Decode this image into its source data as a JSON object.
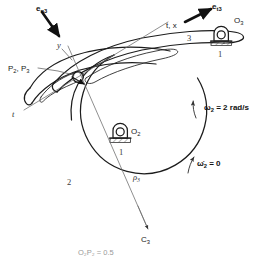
{
  "figure": {
    "background_color": "#ffffff",
    "line_color": "#1c1c1c"
  },
  "vectors": [
    {
      "id": "e_n3",
      "base": "e",
      "subscript": "n3",
      "label": "e",
      "bold": true,
      "description": "normal unit vector arrow, upper left, pointing down-right"
    },
    {
      "id": "e_t3",
      "base": "e",
      "subscript": "t3",
      "label": "e",
      "bold": true,
      "description": "tangential unit vector arrow, upper right, pointing up-right"
    }
  ],
  "axes": [
    {
      "id": "y-axis",
      "label": "y",
      "description": "normal axis line through contact point"
    },
    {
      "id": "tx-axis",
      "label": "t, x",
      "description": "tangent axis upper right end"
    },
    {
      "id": "t-axis",
      "label": "t",
      "description": "tangent axis lower left end"
    }
  ],
  "points": [
    {
      "id": "P2P3",
      "label": "P",
      "subscript": "2",
      "label2": ", P",
      "subscript2": "3",
      "full": "P2, P3",
      "description": "coincident points at pin-in-slot joint"
    },
    {
      "id": "O2",
      "label": "O",
      "subscript": "2",
      "description": "ground pivot of link 2"
    },
    {
      "id": "O3",
      "label": "O",
      "subscript": "3",
      "description": "ground pivot of link 3"
    },
    {
      "id": "C3",
      "label": "C",
      "subscript": "3",
      "description": "center of curvature of link 3 surface"
    }
  ],
  "links": [
    {
      "id": "link-1-left",
      "label": "1",
      "description": "ground link at O2"
    },
    {
      "id": "link-1-right",
      "label": "1",
      "description": "ground link at O3"
    },
    {
      "id": "link-2",
      "label": "2",
      "description": "driving cam disk"
    },
    {
      "id": "link-3",
      "label": "3",
      "description": "slotted follower arm"
    }
  ],
  "dimensions": [
    {
      "id": "rho3",
      "label": "ρ",
      "subscript": "3",
      "description": "radius of curvature of link 3"
    }
  ],
  "annotations": [
    {
      "id": "omega2",
      "symbol": "ω",
      "subscript": "2",
      "equals": " = 2 rad/s",
      "full": "ω2 = 2 rad/s",
      "bold": true,
      "description": "angular velocity of link 2, counterclockwise"
    },
    {
      "id": "omega2-dot",
      "symbol": "ω̇",
      "subscript": "2",
      "equals": " = 0",
      "full": "ω̇2 = 0",
      "bold": true,
      "description": "angular acceleration of link 2 is zero"
    }
  ],
  "caption": {
    "text": "O₂P₂ = 0.5",
    "visible": "partially cropped at bottom edge"
  }
}
